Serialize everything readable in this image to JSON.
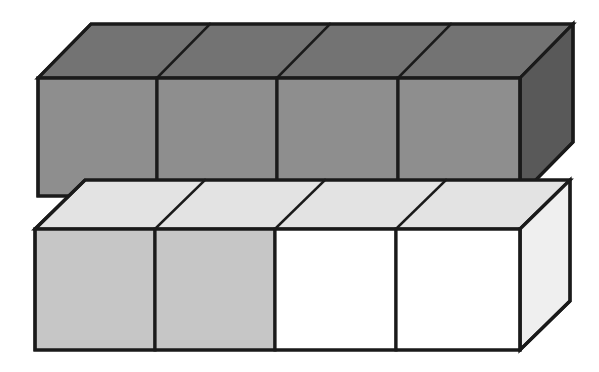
{
  "figure": {
    "canvas": {
      "width": 599,
      "height": 372,
      "background": "#ffffff"
    },
    "line": {
      "color": "#1a1a1a",
      "width": 3.2,
      "thin_width": 2.6
    },
    "colors": {
      "top_slab_front": "#8e8e8e",
      "top_slab_top": "#737373",
      "top_slab_side": "#595959",
      "bottom_slab_front_shaded": "#c6c6c6",
      "bottom_slab_front_plain": "#ffffff",
      "bottom_slab_top": "#e3e3e3",
      "bottom_slab_side": "#efefef"
    },
    "slabs": [
      {
        "name": "upper-slab",
        "label": "upper slab",
        "cube_count": 4,
        "shaded_cube_count": 4,
        "front": {
          "x0": 38,
          "x1": 520,
          "y0": 78,
          "y1": 196
        },
        "depth": {
          "dx": 53,
          "dy": -54
        },
        "front_dividers": [
          157,
          277,
          398
        ],
        "cube_fills": [
          "#8e8e8e",
          "#8e8e8e",
          "#8e8e8e",
          "#8e8e8e"
        ],
        "top_fill": "#737373",
        "side_fill": "#595959"
      },
      {
        "name": "lower-slab",
        "label": "lower slab",
        "cube_count": 4,
        "shaded_cube_count": 2,
        "front": {
          "x0": 35,
          "x1": 520,
          "y0": 229,
          "y1": 350
        },
        "depth": {
          "dx": 50,
          "dy": -49
        },
        "front_dividers": [
          155,
          275,
          396
        ],
        "cube_fills": [
          "#c6c6c6",
          "#c6c6c6",
          "#ffffff",
          "#ffffff"
        ],
        "top_fill": "#e3e3e3",
        "side_fill": "#efefef"
      }
    ],
    "chart_data": {
      "type": "diagram",
      "title": "Two stacked 1x4 slabs of unit cubes",
      "rows": [
        {
          "row": "upper",
          "cubes": 4,
          "shaded": 4,
          "unshaded": 0,
          "fill": "dark gray"
        },
        {
          "row": "lower",
          "cubes": 4,
          "shaded": 2,
          "unshaded": 2,
          "fill": "light gray / white"
        }
      ],
      "total_cubes": 8,
      "total_shaded": 6,
      "fraction_shaded": "6/8"
    }
  }
}
